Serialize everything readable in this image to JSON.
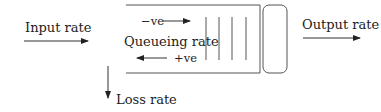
{
  "diagram": {
    "type": "queue-flow",
    "labels": {
      "input": "Input rate",
      "output": "Output rate",
      "queueing": "Queueing rate",
      "negative": "−ve",
      "positive": "+ve",
      "loss": "Loss rate"
    },
    "nodes": [
      {
        "id": "queue-buffer",
        "shape": "open-rectangle",
        "slots": 4
      },
      {
        "id": "server",
        "shape": "rounded-rectangle"
      }
    ],
    "edges": [
      {
        "from": "input",
        "to": "queue-buffer",
        "label": "Input rate",
        "direction": "right"
      },
      {
        "from": "server",
        "to": "output",
        "label": "Output rate",
        "direction": "right"
      },
      {
        "from": "queue-buffer",
        "to": "loss",
        "label": "Loss rate",
        "direction": "down"
      },
      {
        "label": "−ve",
        "direction": "right",
        "context": "queueing rate"
      },
      {
        "label": "+ve",
        "direction": "left",
        "context": "queueing rate"
      }
    ],
    "colors": {
      "stroke": "#333333",
      "text": "#222222",
      "background": "#ffffff"
    }
  }
}
